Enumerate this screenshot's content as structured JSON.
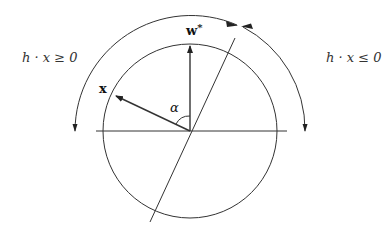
{
  "diagram": {
    "type": "geometric-vector-diagram",
    "labels": {
      "left_region": "h · x ≥ 0",
      "right_region": "h · x ≤ 0",
      "vector_w": "w*",
      "vector_w_base": "w",
      "vector_w_sup": "*",
      "vector_x": "x",
      "angle": "α"
    },
    "elements": {
      "circle": {
        "cx": 190,
        "cy": 131,
        "r": 87
      },
      "horizontal_line": {
        "x1": 96,
        "y1": 131,
        "x2": 287,
        "y2": 131
      },
      "separating_line": {
        "x1": 150,
        "y1": 222,
        "x2": 235,
        "y2": 38
      },
      "vector_w": {
        "from": [
          190,
          131
        ],
        "to": [
          190,
          46
        ]
      },
      "vector_x": {
        "from": [
          190,
          131
        ],
        "to": [
          116,
          96
        ]
      },
      "outer_arc": {
        "cx": 190,
        "cy": 131,
        "r": 116,
        "meeting_point_angle_deg": 64
      },
      "stroke_color": "#333333"
    }
  }
}
